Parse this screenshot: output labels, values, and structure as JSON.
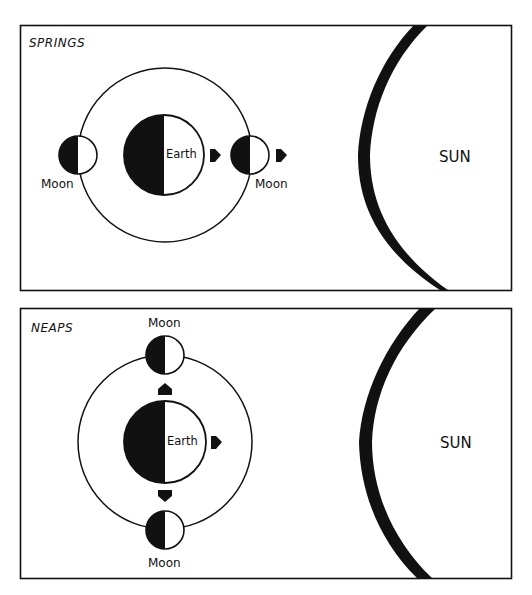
{
  "diagram": {
    "topic": "Spring and neap tides: Sun-Earth-Moon alignment",
    "colors": {
      "ink": "#111111",
      "background": "#ffffff",
      "lit_side": "#ffffff",
      "dark_side": "#111111"
    },
    "panels": [
      {
        "id": "springs",
        "title": "SPRINGS",
        "earth_label": "Earth",
        "moon_labels": [
          "Moon",
          "Moon"
        ],
        "sun_label": "SUN",
        "moon_positions": [
          "left (opposite Sun, full)",
          "right (between Earth and Sun, new)"
        ],
        "arrows": [
          "Earth toward Sun",
          "Moon toward Sun"
        ]
      },
      {
        "id": "neaps",
        "title": "NEAPS",
        "earth_label": "Earth",
        "moon_labels": [
          "Moon",
          "Moon"
        ],
        "sun_label": "SUN",
        "moon_positions": [
          "top (quarter)",
          "bottom (quarter)"
        ],
        "arrows": [
          "Earth toward Sun",
          "toward top Moon",
          "toward bottom Moon"
        ]
      }
    ]
  }
}
